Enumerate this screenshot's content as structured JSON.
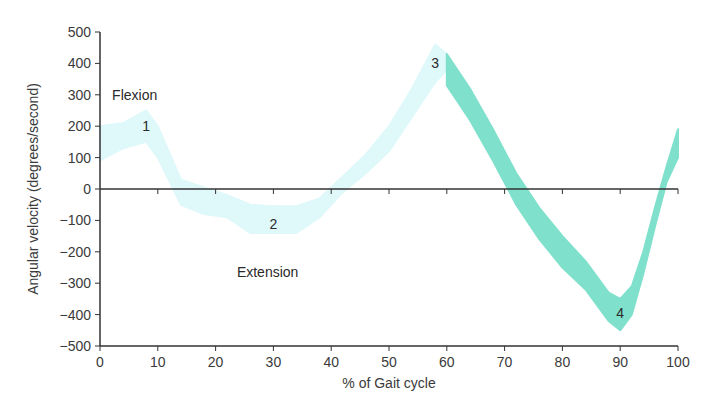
{
  "chart_data": {
    "type": "area",
    "title": "",
    "xlabel": "% of Gait cycle",
    "ylabel": "Angular velocity (degrees/second)",
    "xlim": [
      0,
      100
    ],
    "ylim": [
      -500,
      500
    ],
    "x_ticks": [
      0,
      10,
      20,
      30,
      40,
      50,
      60,
      70,
      80,
      90,
      100
    ],
    "y_ticks": [
      500,
      400,
      300,
      200,
      100,
      0,
      -100,
      -200,
      -300,
      -400,
      -500
    ],
    "grid": false,
    "series": [
      {
        "name": "Swing-preparation / stance band (light)",
        "color": "#dff8f9",
        "x": [
          0,
          4,
          8,
          10,
          14,
          18,
          22,
          26,
          30,
          34,
          38,
          42,
          46,
          50,
          54,
          58,
          60
        ],
        "upper": [
          200,
          210,
          250,
          200,
          30,
          5,
          -20,
          -50,
          -55,
          -55,
          -30,
          40,
          110,
          200,
          320,
          460,
          430
        ],
        "lower": [
          90,
          130,
          150,
          100,
          -50,
          -80,
          -90,
          -140,
          -140,
          -140,
          -90,
          -10,
          50,
          120,
          230,
          340,
          380
        ]
      },
      {
        "name": "Swing band (dark)",
        "color": "#7fe0cc",
        "x": [
          60,
          64,
          68,
          72,
          76,
          80,
          84,
          88,
          90,
          92,
          94,
          96,
          98,
          100
        ],
        "upper": [
          430,
          320,
          190,
          50,
          -60,
          -150,
          -230,
          -330,
          -350,
          -310,
          -200,
          -60,
          70,
          190
        ],
        "lower": [
          330,
          220,
          90,
          -50,
          -160,
          -250,
          -320,
          -420,
          -450,
          -400,
          -270,
          -120,
          20,
          100
        ]
      }
    ],
    "annotations": [
      {
        "text": "Flexion",
        "x": 6,
        "y": 300
      },
      {
        "text": "Extension",
        "x": 29,
        "y": -265
      },
      {
        "text": "1",
        "x": 8,
        "y": 200
      },
      {
        "text": "2",
        "x": 30,
        "y": -110
      },
      {
        "text": "3",
        "x": 58,
        "y": 400
      },
      {
        "text": "4",
        "x": 90,
        "y": -395
      }
    ],
    "legend": null
  }
}
